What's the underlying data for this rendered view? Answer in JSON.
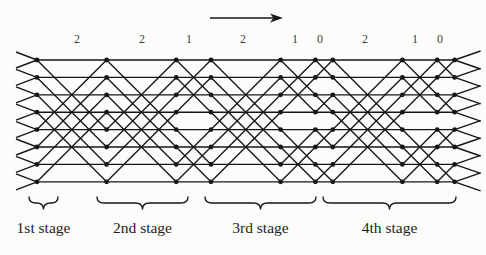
{
  "figure": {
    "background": "#fcfcfb",
    "line_color": "#161616",
    "distance_label_color": "#3d3d3d",
    "stage_label_color": "#1c1c1c",
    "arrow": {
      "x_start": 210,
      "x_end": 283,
      "y": 18
    },
    "distance_labels": {
      "y": 43,
      "items": [
        {
          "text": "2",
          "x": 77
        },
        {
          "text": "2",
          "x": 142
        },
        {
          "text": "1",
          "x": 189
        },
        {
          "text": "2",
          "x": 243
        },
        {
          "text": "1",
          "x": 295
        },
        {
          "text": "0",
          "x": 320
        },
        {
          "text": "2",
          "x": 365
        },
        {
          "text": "1",
          "x": 415
        },
        {
          "text": "0",
          "x": 440
        }
      ]
    },
    "network": {
      "wire_count": 8,
      "first_wire_y": 60,
      "wire_spacing": 17.4,
      "columns_x": [
        37,
        106.6,
        176.2,
        211,
        280.6,
        315.4,
        332.8,
        402.4,
        437.2,
        454.6
      ],
      "crossing_distances": [
        4,
        4,
        2,
        4,
        2,
        1,
        4,
        2,
        1
      ],
      "dot_radius": 2.4,
      "stub_left": {
        "dx": 21,
        "dy": 8
      },
      "stub_right": {
        "dx": 26,
        "dy": 9
      }
    },
    "stages": {
      "brace_y_tip": 197,
      "brace_y_bar": 203,
      "brace_y_cusp": 209.5,
      "label_y": 233,
      "items": [
        {
          "label": "1st stage",
          "x1": 29,
          "x2": 58
        },
        {
          "label": "2nd stage",
          "x1": 97,
          "x2": 188
        },
        {
          "label": "3rd stage",
          "x1": 205,
          "x2": 316
        },
        {
          "label": "4th stage",
          "x1": 323,
          "x2": 456
        }
      ]
    }
  }
}
